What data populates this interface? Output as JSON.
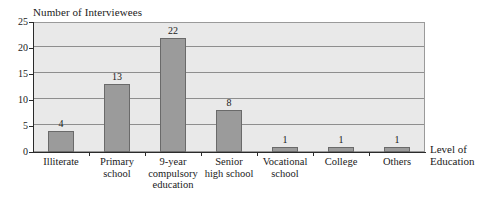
{
  "chart_data": {
    "type": "bar",
    "title": "",
    "ylabel": "Number of Interviewees",
    "xlabel": "Level of Education",
    "categories": [
      "Illiterate",
      "Primary school",
      "9-year compulsory education",
      "Senior high school",
      "Vocational school",
      "College",
      "Others"
    ],
    "category_lines": [
      [
        "Illiterate"
      ],
      [
        "Primary",
        "school"
      ],
      [
        "9-year",
        "compulsory",
        "education"
      ],
      [
        "Senior",
        "high school"
      ],
      [
        "Vocational",
        "school"
      ],
      [
        "College"
      ],
      [
        "Others"
      ]
    ],
    "values": [
      4,
      13,
      22,
      8,
      1,
      1,
      1
    ],
    "value_labels": [
      "4",
      "13",
      "22",
      "8",
      "1",
      "1",
      "1"
    ],
    "ylim": [
      0,
      25
    ],
    "yticks": [
      0,
      5,
      10,
      15,
      20,
      25
    ],
    "ytick_labels": [
      "0",
      "5",
      "10",
      "15",
      "20",
      "25"
    ],
    "grid": true,
    "legend": "none",
    "colors": {
      "bar_fill": "#9b9b9b",
      "bar_border": "#6a6a6a",
      "plot_background": "#e9e9e9",
      "gridline": "#8e8e8e",
      "axis": "#2b2b2b",
      "text": "#1a1a1a",
      "page_background": "#ffffff"
    }
  }
}
